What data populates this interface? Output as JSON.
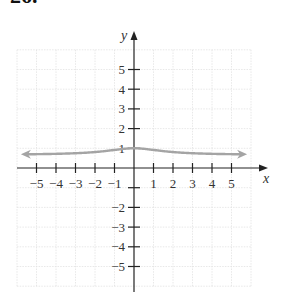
{
  "problem_number": "26.",
  "chart_data": {
    "type": "line",
    "title": "",
    "xlabel": "x",
    "ylabel": "y",
    "xlim": [
      -6,
      6
    ],
    "ylim": [
      -6,
      6
    ],
    "grid": true,
    "legend": null,
    "x_ticks": [
      -5,
      -4,
      -3,
      -2,
      -1,
      1,
      2,
      3,
      4,
      5
    ],
    "x_tick_labels": [
      "−5",
      "−4",
      "−3",
      "−2",
      "−1",
      "1",
      "2",
      "3",
      "4",
      "5"
    ],
    "y_ticks": [
      5,
      4,
      3,
      2,
      1,
      -1,
      -2,
      -3,
      -4,
      -5
    ],
    "y_tick_labels": [
      "5",
      "4",
      "3",
      "2",
      "1",
      "",
      "−2",
      "−3",
      "−4",
      "−5"
    ],
    "series": [
      {
        "name": "f(x)",
        "color": "#a4a4a4",
        "arrows_both_ends": true,
        "x": [
          -5.8,
          -5,
          -4,
          -3,
          -2,
          -1,
          0,
          1,
          2,
          3,
          4,
          5,
          5.8
        ],
        "y": [
          0.69,
          0.7,
          0.72,
          0.75,
          0.81,
          0.92,
          1.0,
          0.92,
          0.81,
          0.75,
          0.72,
          0.7,
          0.69
        ]
      }
    ],
    "annotations": [
      "horizontal asymptote near y ≈ 2/3",
      "maximum at (0, 1)"
    ]
  }
}
